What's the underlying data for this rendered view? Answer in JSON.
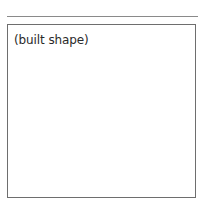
{
  "figure": {
    "placeholder_label": "(built shape)"
  },
  "colors": {
    "rule": "#8a8a8a",
    "frame_border": "#6e6e6e",
    "text": "#2a2a2a",
    "background": "#ffffff"
  }
}
